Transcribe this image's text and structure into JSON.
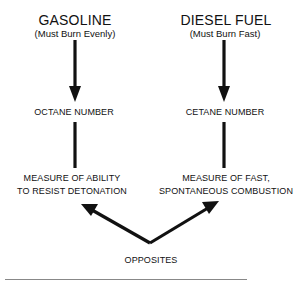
{
  "left": {
    "title": "GASOLINE",
    "subtitle": "(Must Burn Evenly)",
    "node": "OCTANE NUMBER",
    "desc_line1": "MEASURE OF ABILITY",
    "desc_line2": "TO RESIST DETONATION"
  },
  "right": {
    "title": "DIESEL FUEL",
    "subtitle": "(Must Burn Fast)",
    "node": "CETANE NUMBER",
    "desc_line1": "MEASURE OF FAST,",
    "desc_line2": "SPONTANEOUS COMBUSTION"
  },
  "bottom": {
    "label": "OPPOSITES"
  },
  "colors": {
    "ink": "#111111",
    "background": "#ffffff"
  }
}
